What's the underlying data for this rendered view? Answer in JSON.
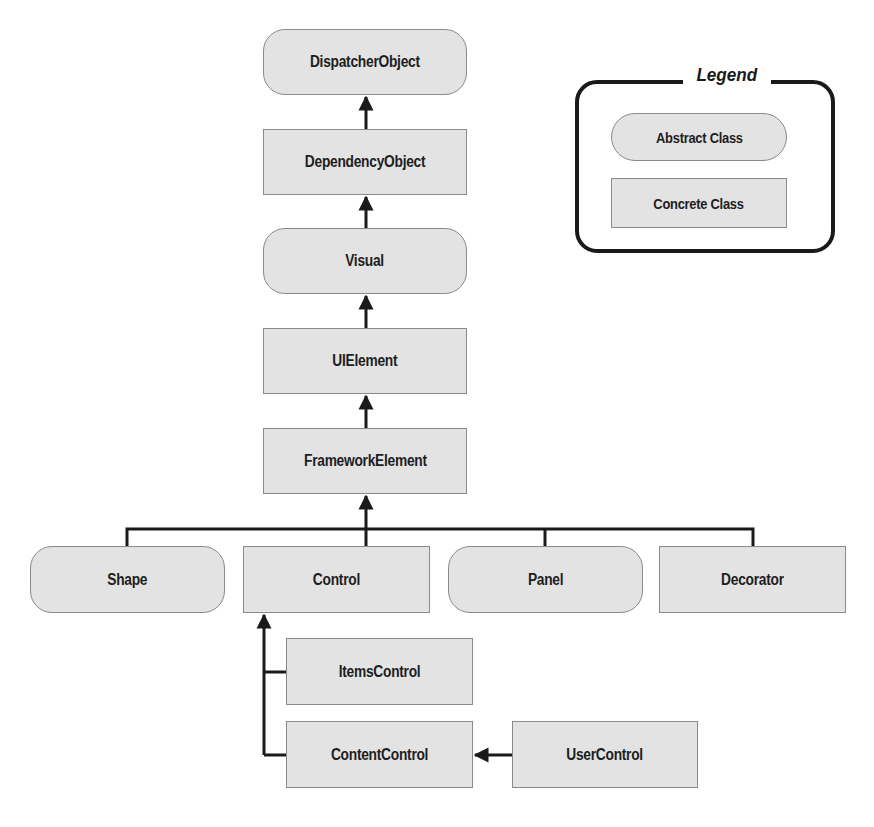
{
  "diagram": {
    "type": "class-hierarchy",
    "nodes": {
      "dispatcher_object": {
        "label": "DispatcherObject",
        "kind": "abstract"
      },
      "dependency_object": {
        "label": "DependencyObject",
        "kind": "concrete"
      },
      "visual": {
        "label": "Visual",
        "kind": "abstract"
      },
      "ui_element": {
        "label": "UIElement",
        "kind": "concrete"
      },
      "framework_element": {
        "label": "FrameworkElement",
        "kind": "concrete"
      },
      "shape": {
        "label": "Shape",
        "kind": "abstract"
      },
      "control": {
        "label": "Control",
        "kind": "concrete"
      },
      "panel": {
        "label": "Panel",
        "kind": "abstract"
      },
      "decorator": {
        "label": "Decorator",
        "kind": "concrete"
      },
      "items_control": {
        "label": "ItemsControl",
        "kind": "concrete"
      },
      "content_control": {
        "label": "ContentControl",
        "kind": "concrete"
      },
      "user_control": {
        "label": "UserControl",
        "kind": "concrete"
      }
    },
    "edges": [
      {
        "from": "DependencyObject",
        "to": "DispatcherObject"
      },
      {
        "from": "Visual",
        "to": "DependencyObject"
      },
      {
        "from": "UIElement",
        "to": "Visual"
      },
      {
        "from": "FrameworkElement",
        "to": "UIElement"
      },
      {
        "from": "Shape",
        "to": "FrameworkElement"
      },
      {
        "from": "Control",
        "to": "FrameworkElement"
      },
      {
        "from": "Panel",
        "to": "FrameworkElement"
      },
      {
        "from": "Decorator",
        "to": "FrameworkElement"
      },
      {
        "from": "ItemsControl",
        "to": "Control"
      },
      {
        "from": "ContentControl",
        "to": "Control"
      },
      {
        "from": "UserControl",
        "to": "ContentControl"
      }
    ]
  },
  "legend": {
    "title": "Legend",
    "abstract_label": "Abstract Class",
    "concrete_label": "Concrete Class"
  },
  "colors": {
    "node_fill": "#e3e3e3",
    "node_border": "#8a8a8a",
    "line": "#1a1a1a"
  }
}
